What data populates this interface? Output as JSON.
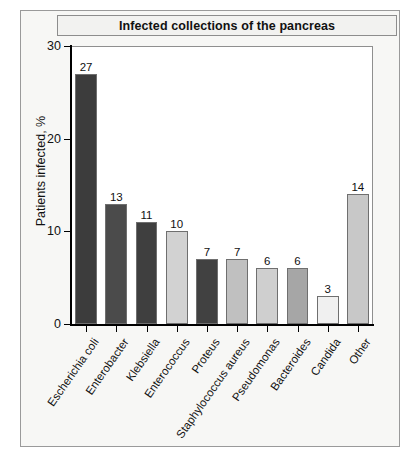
{
  "figure": {
    "title": "Infected collections of the pancreas"
  },
  "chart_data": {
    "type": "bar",
    "title": "Infected collections of the pancreas",
    "xlabel": "",
    "ylabel": "Patients infected, %",
    "ylim": [
      0,
      30
    ],
    "yticks": [
      0,
      10,
      20,
      30
    ],
    "ytick_labels": [
      "0",
      "10",
      "20",
      "30"
    ],
    "grid": false,
    "legend": false,
    "categories": [
      "Escherichia coli",
      "Enterobacter",
      "Klebsiella",
      "Enterococcus",
      "Proteus",
      "Staphylococcus aureus",
      "Pseudomonas",
      "Bacteroides",
      "Candida",
      "Other"
    ],
    "values": [
      27,
      13,
      11,
      10,
      7,
      7,
      6,
      6,
      3,
      14
    ],
    "value_labels": [
      "27",
      "13",
      "11",
      "10",
      "7",
      "7",
      "6",
      "6",
      "3",
      "14"
    ],
    "bar_colors": [
      "#3c3c3c",
      "#4b4b4b",
      "#3f3f3f",
      "#d2d2d2",
      "#414141",
      "#c0c0c0",
      "#cfcfcf",
      "#a6a6a6",
      "#f0f0f0",
      "#c8c8c8"
    ],
    "bar_edge_color": "#6f6f6f",
    "axis_color": "#000000",
    "plot_background": "#ffffff",
    "figure_background": "#f7f7f5"
  }
}
